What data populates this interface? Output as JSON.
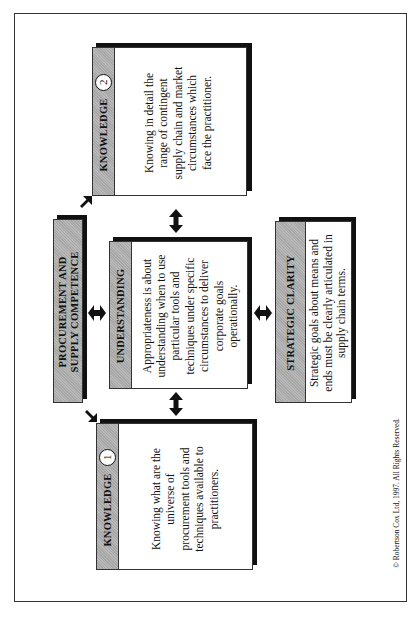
{
  "diagram": {
    "orientation": "rotated 90 degrees counter-clockwise",
    "central": {
      "title_line1": "PROCUREMENT AND",
      "title_line2": "SUPPLY COMPETENCE"
    },
    "knowledge1": {
      "title": "KNOWLEDGE",
      "number": "1",
      "text": "Knowing what are the universe of procurement tools and techniques available to practitioners."
    },
    "knowledge2": {
      "title": "KNOWLEDGE",
      "number": "2",
      "text": "Knowing in detail the range of contingent supply chain and market circumstances which face the practitioner."
    },
    "understanding": {
      "title": "UNDERSTANDING",
      "text": "Appropriateness is about understanding when to use particular tools and techniques under specific circumstances to deliver corporate goals operationally."
    },
    "strategic_clarity": {
      "title": "STRATEGIC CLARITY",
      "text": "Strategic goals about means and ends must be clearly articulated in supply chain terms."
    },
    "colors": {
      "band_gray": "#b9b9b9",
      "shadow": "#111111",
      "border": "#333333"
    },
    "copyright": "© Robertson Cox Ltd, 1997.   All Rights Reserved."
  }
}
